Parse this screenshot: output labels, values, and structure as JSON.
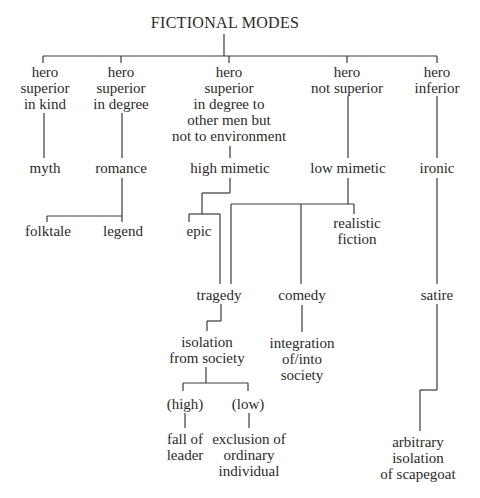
{
  "title": "FICTIONAL MODES",
  "modes": [
    {
      "hero": [
        "hero",
        "superior",
        "in kind"
      ],
      "mode": "myth"
    },
    {
      "hero": [
        "hero",
        "superior",
        "in degree"
      ],
      "mode": "romance",
      "subtypes": [
        "folktale",
        "legend"
      ]
    },
    {
      "hero": [
        "hero",
        "superior",
        "in degree to",
        "other men but",
        "not to environment"
      ],
      "mode": "high mimetic",
      "subtypes": [
        "epic"
      ]
    },
    {
      "hero": [
        "hero",
        "not superior"
      ],
      "mode": "low mimetic",
      "subtypes": [
        "realistic",
        "fiction"
      ]
    },
    {
      "hero": [
        "hero",
        "inferior"
      ],
      "mode": "ironic"
    }
  ],
  "genres": {
    "tragedy": {
      "label": "tragedy",
      "theme": [
        "isolation",
        "from society"
      ],
      "branches": [
        {
          "label": "(high)",
          "result": [
            "fall of",
            "leader"
          ]
        },
        {
          "label": "(low)",
          "result": [
            "exclusion of",
            "ordinary",
            "individual"
          ]
        }
      ]
    },
    "comedy": {
      "label": "comedy",
      "theme": [
        "integration",
        "of/into",
        "society"
      ]
    },
    "satire": {
      "label": "satire",
      "theme": [
        "arbitrary",
        "isolation",
        "of scapegoat"
      ]
    }
  }
}
